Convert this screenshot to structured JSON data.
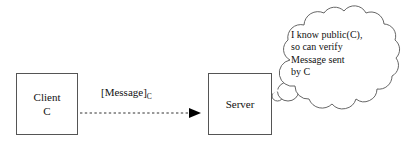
{
  "diagram": {
    "background_color": "#ffffff",
    "stroke_color": "#555555",
    "text_color": "#111111",
    "nodes": [
      {
        "id": "client",
        "name": "client-node",
        "shape": "rectangle",
        "lines": [
          "Client",
          "C"
        ],
        "x": 16,
        "y": 73,
        "width": 62,
        "height": 62
      },
      {
        "id": "server",
        "name": "server-node",
        "shape": "rectangle",
        "lines": [
          "Server"
        ],
        "x": 208,
        "y": 73,
        "width": 64,
        "height": 62
      }
    ],
    "edges": [
      {
        "id": "message-arrow",
        "from": "client",
        "to": "server",
        "style": "dashed",
        "arrowhead": "filled-triangle",
        "label": "[Message]",
        "label_subscript": "C",
        "x1": 80,
        "y1": 113,
        "x2": 200,
        "y2": 113
      }
    ],
    "thought_bubble": {
      "id": "server-thought",
      "attached_to": "server",
      "lines": [
        "I know public(C),",
        "so can verify",
        "Message sent",
        "by C"
      ]
    }
  }
}
